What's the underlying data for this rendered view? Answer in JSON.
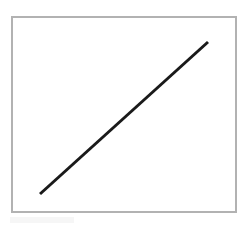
{
  "figure": {
    "title": "",
    "caption": "",
    "background_color": "#ffffff",
    "canvas": {
      "width": 246,
      "height": 227
    }
  },
  "frame": {
    "name": "plot-border",
    "color": "#b2b2b2",
    "stroke_width": 2,
    "x": 11,
    "y": 16,
    "width": 226,
    "height": 197
  },
  "chart_data": {
    "type": "line",
    "title": "",
    "subtitle": "",
    "xlabel": "",
    "ylabel": "",
    "grid": false,
    "legend": null,
    "legend_position": "none",
    "xticks": [],
    "yticks": [],
    "xticklabels": [],
    "yticklabels": [],
    "xlim": [
      0,
      1
    ],
    "ylim": [
      0,
      1
    ],
    "annotations": [],
    "series": [
      {
        "name": "diagonal",
        "color": "#1a1a1a",
        "line_width": 3,
        "line_style": "solid",
        "marker": "none",
        "x": [
          0.128,
          1.0
        ],
        "y": [
          0.0,
          1.0
        ],
        "pixel_points": [
          {
            "x": 40,
            "y": 194
          },
          {
            "x": 208,
            "y": 42
          }
        ]
      }
    ]
  },
  "artifact": {
    "name": "compression-smudge",
    "color": "#f4f4f4"
  }
}
